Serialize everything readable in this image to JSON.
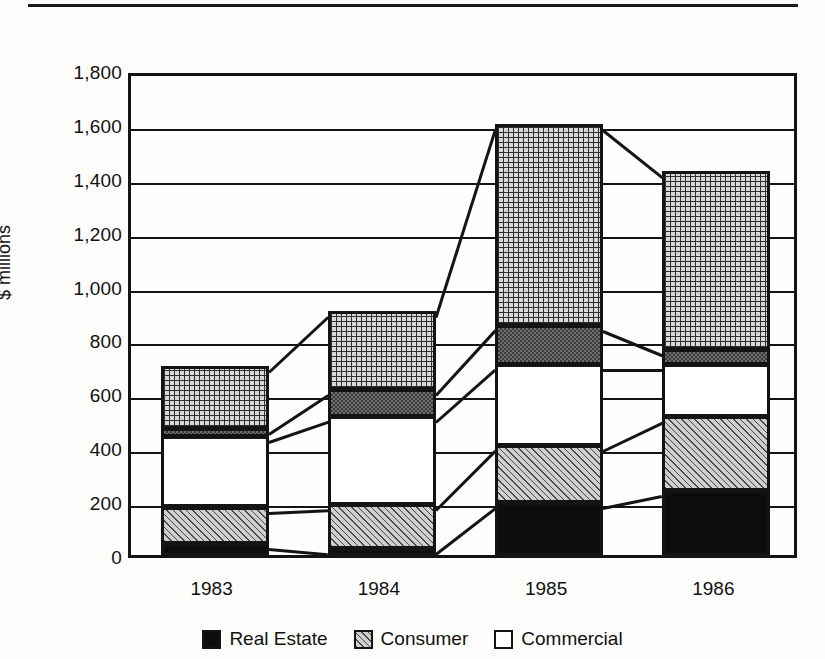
{
  "chart_data": {
    "type": "bar",
    "stacked": true,
    "title": "",
    "xlabel": "",
    "ylabel": "$ millions",
    "categories": [
      "1983",
      "1984",
      "1985",
      "1986"
    ],
    "ylim": [
      0,
      1800
    ],
    "ytick_step": 200,
    "ytick_labels": [
      "1,800",
      "1,600",
      "1,400",
      "1,200",
      "1,000",
      "800",
      "600",
      "400",
      "200",
      "0"
    ],
    "ytick_values": [
      1800,
      1600,
      1400,
      1200,
      1000,
      800,
      600,
      400,
      200,
      0
    ],
    "grid": true,
    "legend_position": "bottom",
    "series": [
      {
        "name": "Real Estate",
        "pattern": "solid-black",
        "values": [
          45,
          25,
          195,
          240
        ]
      },
      {
        "name": "Consumer",
        "pattern": "diagonal-hatch",
        "values": [
          135,
          165,
          215,
          275
        ]
      },
      {
        "name": "Commercial",
        "pattern": "white",
        "values": [
          260,
          325,
          300,
          195
        ]
      },
      {
        "name": "Other (dark band)",
        "pattern": "dark-fine",
        "values": [
          30,
          100,
          145,
          55
        ]
      },
      {
        "name": "Other (grid)",
        "pattern": "cross-grid",
        "values": [
          230,
          290,
          745,
          660
        ]
      }
    ],
    "totals": [
      700,
      905,
      1600,
      1425
    ]
  },
  "axis": {
    "y_title": "$ millions"
  },
  "legend": {
    "items": [
      {
        "label": "Real Estate",
        "swatch": "solid-black"
      },
      {
        "label": "Consumer",
        "swatch": "diagonal-hatch"
      },
      {
        "label": "Commercial",
        "swatch": "white"
      }
    ]
  }
}
